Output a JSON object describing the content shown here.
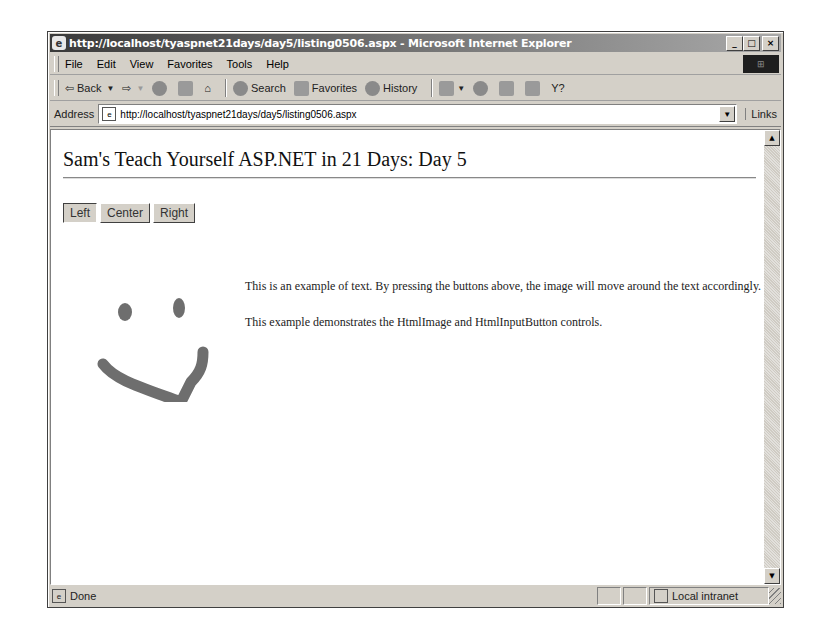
{
  "window": {
    "title": "http://localhost/tyaspnet21days/day5/listing0506.aspx - Microsoft Internet Explorer",
    "controls": {
      "minimize": "_",
      "maximize": "□",
      "close": "×"
    }
  },
  "menu": {
    "items": [
      "File",
      "Edit",
      "View",
      "Favorites",
      "Tools",
      "Help"
    ]
  },
  "toolbar": {
    "back": "Back",
    "search": "Search",
    "favorites": "Favorites",
    "history": "History"
  },
  "address": {
    "label": "Address",
    "url": "http://localhost/tyaspnet21days/day5/listing0506.aspx",
    "links": "Links"
  },
  "page": {
    "heading": "Sam's Teach Yourself ASP.NET in 21 Days: Day 5",
    "buttons": [
      {
        "label": "Left",
        "active": true
      },
      {
        "label": "Center",
        "active": false
      },
      {
        "label": "Right",
        "active": false
      }
    ],
    "paragraph1": "This is an example of text. By pressing the buttons above, the image will move around the text accordingly.",
    "paragraph2": "This example demonstrates the HtmlImage and HtmlInputButton controls.",
    "image": {
      "icon": "smiley-face",
      "alignment": "left"
    }
  },
  "status": {
    "text": "Done",
    "zone": "Local intranet"
  }
}
